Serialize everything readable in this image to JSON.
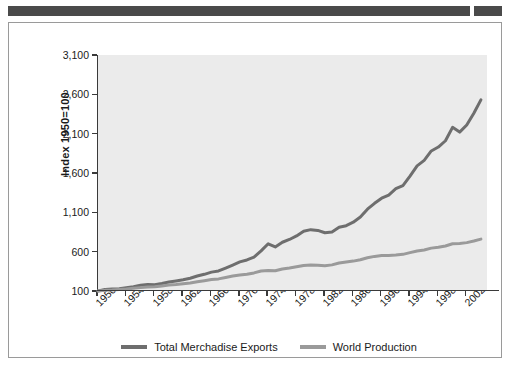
{
  "figure": {
    "background_color": "#ffffff",
    "plot_background_color": "#ebebeb",
    "top_bar_color": "#4a4a4a"
  },
  "legend": {
    "position": "bottom-center",
    "items": [
      {
        "label": "Total Merchadise Exports",
        "color": "#6e6e6e"
      },
      {
        "label": "World Production",
        "color": "#9a9a9a"
      }
    ]
  },
  "chart_data": {
    "type": "line",
    "title": "",
    "subtitle": "",
    "xlabel": "",
    "ylabel": "Index 1950=100",
    "grid": false,
    "legend_position": "bottom",
    "ylim": [
      100,
      3100
    ],
    "yticks": [
      100,
      600,
      1100,
      1600,
      2100,
      2600,
      3100
    ],
    "ytick_labels": [
      "100",
      "600",
      "1,100",
      "1,600",
      "2,100",
      "2,600",
      "3,100"
    ],
    "xlim": [
      1950,
      2005
    ],
    "xticks": [
      1950,
      1954,
      1958,
      1962,
      1966,
      1970,
      1974,
      1978,
      1982,
      1986,
      1990,
      1994,
      1998,
      2002
    ],
    "xtick_labels": [
      "1950",
      "1954",
      "1958",
      "1962",
      "1966",
      "1970",
      "1974",
      "1978",
      "1982",
      "1986",
      "1990",
      "1994",
      "1998",
      "2002"
    ],
    "x": [
      1950,
      1951,
      1952,
      1953,
      1954,
      1955,
      1956,
      1957,
      1958,
      1959,
      1960,
      1961,
      1962,
      1963,
      1964,
      1965,
      1966,
      1967,
      1968,
      1969,
      1970,
      1971,
      1972,
      1973,
      1974,
      1975,
      1976,
      1977,
      1978,
      1979,
      1980,
      1981,
      1982,
      1983,
      1984,
      1985,
      1986,
      1987,
      1988,
      1989,
      1990,
      1991,
      1992,
      1993,
      1994,
      1995,
      1996,
      1997,
      1998,
      1999,
      2000,
      2001,
      2002,
      2003,
      2004
    ],
    "series": [
      {
        "name": "Total Merchadise Exports",
        "color": "#6e6e6e",
        "values": [
          100,
          120,
          124,
          130,
          142,
          155,
          172,
          182,
          180,
          196,
          215,
          228,
          242,
          262,
          290,
          312,
          340,
          355,
          392,
          430,
          470,
          495,
          530,
          610,
          700,
          660,
          720,
          755,
          800,
          860,
          880,
          870,
          840,
          850,
          910,
          930,
          975,
          1040,
          1140,
          1215,
          1280,
          1320,
          1400,
          1440,
          1560,
          1690,
          1760,
          1880,
          1930,
          2010,
          2180,
          2120,
          2210,
          2360,
          2530
        ]
      },
      {
        "name": "World Production",
        "color": "#9a9a9a",
        "values": [
          100,
          108,
          113,
          120,
          126,
          135,
          143,
          150,
          153,
          165,
          175,
          183,
          193,
          203,
          218,
          231,
          245,
          254,
          272,
          290,
          302,
          313,
          330,
          355,
          362,
          358,
          380,
          392,
          408,
          425,
          430,
          428,
          422,
          432,
          455,
          468,
          480,
          498,
          522,
          540,
          550,
          552,
          558,
          566,
          588,
          608,
          622,
          645,
          655,
          672,
          700,
          705,
          715,
          735,
          760
        ]
      }
    ]
  }
}
